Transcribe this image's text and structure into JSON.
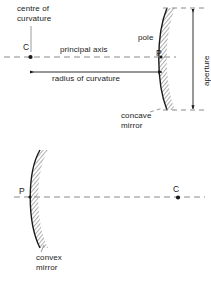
{
  "figure": {
    "background_color": "#ffffff",
    "ink_color": "#1a1a1a",
    "dash_color": "#808080"
  },
  "concave": {
    "label_centre_of_curvature": "centre of\ncurvature",
    "label_c": "C",
    "label_principal_axis": "principal axis",
    "label_pole": "pole",
    "label_p": "P",
    "label_radius_of_curvature": "radius of curvature",
    "label_aperture": "aperture",
    "label_mirror": "concave\nmirror"
  },
  "convex": {
    "label_p": "P",
    "label_c": "C",
    "label_mirror": "convex\nmirror"
  },
  "icons": {
    "centre_point": "filled-dot",
    "pole_point": "pole-marker",
    "radius_arrow": "double-headed-arrow-horizontal",
    "aperture_arrow": "double-headed-arrow-vertical",
    "mirror_arc": "hatched-mirror-arc"
  }
}
